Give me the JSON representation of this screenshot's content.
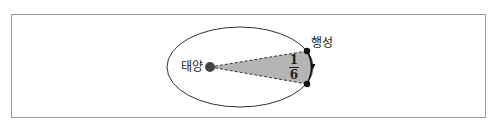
{
  "diagram": {
    "type": "kepler-second-law-orbit",
    "labels": {
      "sun": "태양",
      "planet": "행성",
      "fraction_numerator": "1",
      "fraction_denominator": "6"
    },
    "colors": {
      "frame": "#9a9a9a",
      "orbit": "#333333",
      "sun": "#444444",
      "sector_fill": "#b5b5b5",
      "planet": "#111111"
    }
  }
}
